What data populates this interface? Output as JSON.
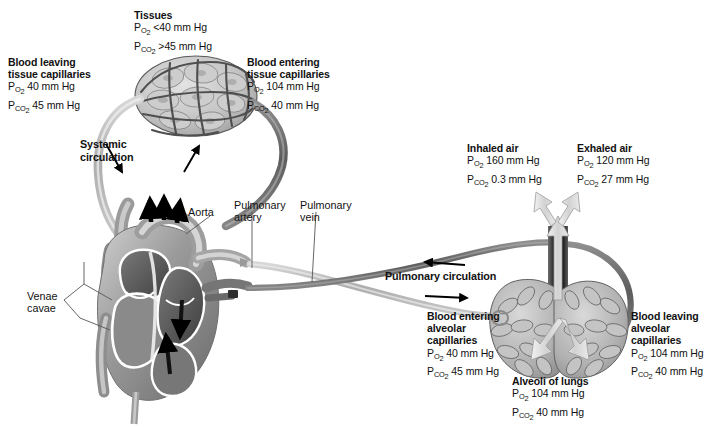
{
  "figure": {
    "type": "anatomical-diagram",
    "background": "#ffffff",
    "units": "mm Hg"
  },
  "labels": {
    "tissues": {
      "heading": "Tissues",
      "po2": "<40 mm Hg",
      "pco2": ">45 mm Hg"
    },
    "blood_leaving_tissue": {
      "heading_line1": "Blood leaving",
      "heading_line2": "tissue capillaries",
      "po2": "40 mm Hg",
      "pco2": "45 mm Hg"
    },
    "blood_entering_tissue": {
      "heading_line1": "Blood entering",
      "heading_line2": "tissue capillaries",
      "po2": "104 mm Hg",
      "pco2": "40 mm Hg"
    },
    "inhaled_air": {
      "heading": "Inhaled air",
      "po2": "160 mm Hg",
      "pco2": "0.3 mm Hg"
    },
    "exhaled_air": {
      "heading": "Exhaled air",
      "po2": "120 mm Hg",
      "pco2": "27 mm Hg"
    },
    "blood_entering_alveolar": {
      "heading_line1": "Blood entering",
      "heading_line2": "alveolar",
      "heading_line3": "capillaries",
      "po2": "40 mm Hg",
      "pco2": "45 mm Hg"
    },
    "blood_leaving_alveolar": {
      "heading_line1": "Blood leaving",
      "heading_line2": "alveolar",
      "heading_line3": "capillaries",
      "po2": "104 mm Hg",
      "pco2": "40 mm Hg"
    },
    "alveoli": {
      "heading": "Alveoli of lungs",
      "po2": "104 mm Hg",
      "pco2": "40 mm Hg"
    },
    "systemic_circulation": {
      "line1": "Systemic",
      "line2": "circulation"
    },
    "pulmonary_circulation": {
      "text": "Pulmonary circulation"
    },
    "anatomy": {
      "aorta": "Aorta",
      "pulmonary_artery_line1": "Pulmonary",
      "pulmonary_artery_line2": "artery",
      "pulmonary_vein_line1": "Pulmonary",
      "pulmonary_vein_line2": "vein",
      "venae_cavae_line1": "Venae",
      "venae_cavae_line2": "cavae"
    }
  },
  "symbols": {
    "p": "P",
    "o2": "O",
    "co2": "CO",
    "two": "2"
  },
  "colors": {
    "oxygenated_vessel": "#6e6e6e",
    "deoxygenated_vessel": "#b4b4b4",
    "tissue_fill": "#c9c9c9",
    "tissue_outline": "#4a4a4a",
    "heart_dark": "#5a5a5a",
    "heart_mid": "#8d8d8d",
    "heart_light": "#d8d8d8",
    "airway_dark": "#2b2b2b",
    "air_arrow": "#cfcfcf",
    "leader_line": "#555555",
    "text": "#111111"
  }
}
